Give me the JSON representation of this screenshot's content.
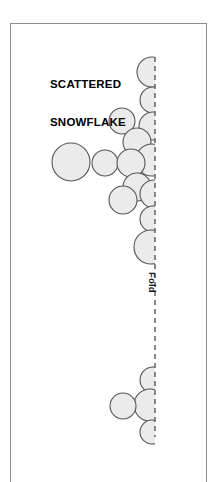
{
  "page": {
    "title_line_1": "SCATTERED",
    "title_line_2": "SNOWFLAKE",
    "title_text": "SCATTERED\nSNOWFLAKE",
    "fold_label": "Fold",
    "background_color": "#ffffff",
    "border_color": "#8d8d8d"
  },
  "diagram": {
    "type": "quilt-block-layout",
    "circle_fill": "#ebebeb",
    "circle_stroke": "#555555",
    "fold_line_color": "#6b6b6b",
    "fold_line_x": 155,
    "fold_line_y_start": 57,
    "fold_line_y_end": 437,
    "circles": [
      {
        "cx": 152,
        "cy": 72,
        "r": 15
      },
      {
        "cx": 153,
        "cy": 100,
        "r": 13
      },
      {
        "cx": 153,
        "cy": 126,
        "r": 14
      },
      {
        "cx": 122,
        "cy": 121,
        "r": 13
      },
      {
        "cx": 137,
        "cy": 142,
        "r": 14
      },
      {
        "cx": 152,
        "cy": 160,
        "r": 16
      },
      {
        "cx": 71,
        "cy": 162,
        "r": 19
      },
      {
        "cx": 105,
        "cy": 163,
        "r": 13
      },
      {
        "cx": 131,
        "cy": 163,
        "r": 14
      },
      {
        "cx": 137,
        "cy": 187,
        "r": 14
      },
      {
        "cx": 123,
        "cy": 200,
        "r": 14
      },
      {
        "cx": 154,
        "cy": 194,
        "r": 14
      },
      {
        "cx": 153,
        "cy": 219,
        "r": 13
      },
      {
        "cx": 151,
        "cy": 247,
        "r": 17
      },
      {
        "cx": 153,
        "cy": 380,
        "r": 13
      },
      {
        "cx": 150,
        "cy": 405,
        "r": 16
      },
      {
        "cx": 123,
        "cy": 406,
        "r": 13
      },
      {
        "cx": 152,
        "cy": 432,
        "r": 12
      }
    ]
  }
}
